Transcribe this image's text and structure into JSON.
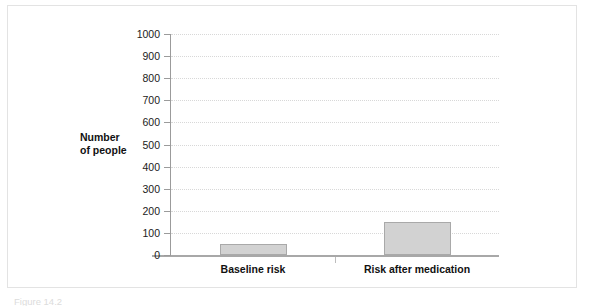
{
  "figure": {
    "caption": "Figure 14.2",
    "border_color": "#e3e3e3",
    "background": "#ffffff"
  },
  "chart_data": {
    "type": "bar",
    "title": "",
    "subtitle": "",
    "xlabel": "",
    "ylabel": "Number of people",
    "ylabel_lines": [
      "Number",
      "of people"
    ],
    "categories": [
      "Baseline risk",
      "Risk after medication"
    ],
    "values": [
      50,
      150
    ],
    "series": [
      {
        "name": "Number of people",
        "values": [
          50,
          150
        ]
      }
    ],
    "ylim": [
      0,
      1000
    ],
    "ytick_step": 100,
    "ytick_labels": [
      "0",
      "100",
      "200",
      "300",
      "400",
      "500",
      "600",
      "700",
      "800",
      "900",
      "1000"
    ],
    "ytick_values": [
      0,
      100,
      200,
      300,
      400,
      500,
      600,
      700,
      800,
      900,
      1000
    ],
    "grid": "horizontal-dotted",
    "legend": "none",
    "bar_fill_color": "#d2d2d2",
    "bar_edge_color": "#a9a9a9",
    "gridline_color": "#d8d8d8",
    "axis_color": "#9b9b9b"
  }
}
